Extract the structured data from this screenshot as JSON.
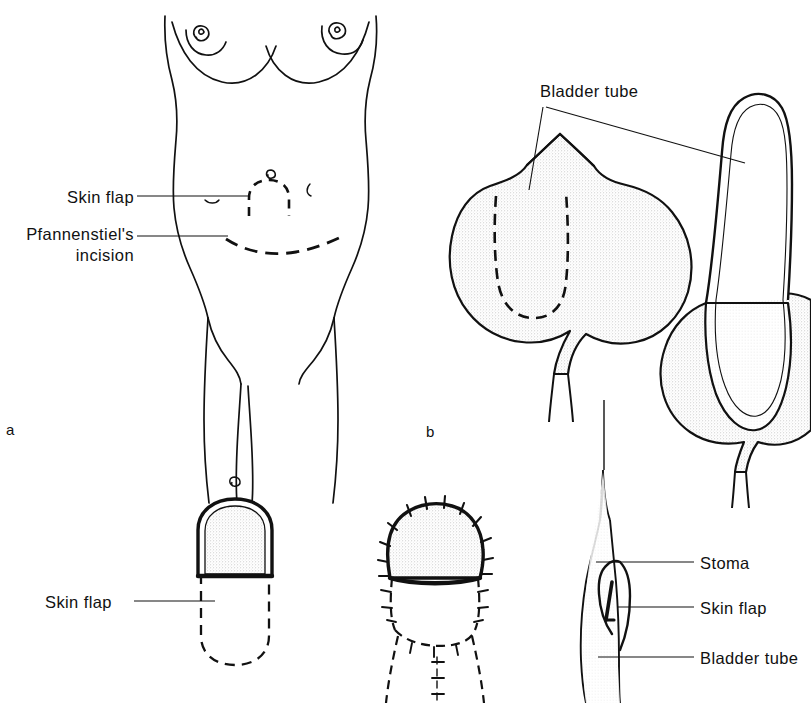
{
  "figure": {
    "background_color": "#ffffff",
    "ink_color": "#111111",
    "stipple_color": "#e8e8e8"
  },
  "panels": [
    {
      "id": "a",
      "letter": "a",
      "caption": "Female torso with planned skin flap and Pfannenstiel's incision"
    },
    {
      "id": "b",
      "letter": "b",
      "caption": "Bladder with outlined tube and bladder tube elevated"
    }
  ],
  "labels": {
    "skin_flap_a": "Skin flap",
    "pfannenstiel_line1": "Pfannenstiel's",
    "pfannenstiel_line2": "incision",
    "bladder_tube_b": "Bladder tube",
    "skin_flap_c": "Skin flap",
    "stoma_e": "Stoma",
    "skin_flap_e": "Skin flap",
    "bladder_tube_e": "Bladder tube"
  },
  "panel_letters": {
    "a": "a",
    "b": "b"
  }
}
